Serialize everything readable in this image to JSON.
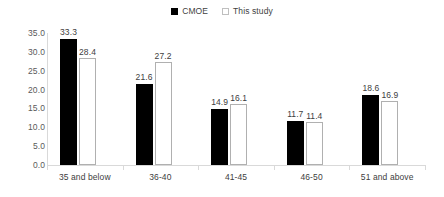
{
  "chart_data": {
    "type": "bar",
    "title": "",
    "subtitle": "",
    "xlabel": "",
    "ylabel": "",
    "categories": [
      "35 and below",
      "36-40",
      "41-45",
      "46-50",
      "51 and above"
    ],
    "series": [
      {
        "name": "CMOE",
        "color": "#000000",
        "style": "filled",
        "values": [
          33.3,
          21.6,
          14.9,
          11.7,
          18.6
        ]
      },
      {
        "name": "This study",
        "color": "#ffffff",
        "style": "hollow",
        "values": [
          28.4,
          27.2,
          16.1,
          11.4,
          16.9
        ]
      }
    ],
    "data_labels": [
      [
        "33.3",
        "21.6",
        "14.9",
        "11.7",
        "18.6"
      ],
      [
        "28.4",
        "27.2",
        "16.1",
        "11.4",
        "16.9"
      ]
    ],
    "ylim": [
      0,
      35
    ],
    "ytick_values": [
      0,
      5,
      10,
      15,
      20,
      25,
      30,
      35
    ],
    "ytick_labels": [
      "0.0",
      "5.0",
      "10.0",
      "15.0",
      "20.0",
      "25.0",
      "30.0",
      "35.0"
    ],
    "grid": false,
    "legend": {
      "position": "top-center",
      "entries": [
        "CMOE",
        "This study"
      ]
    }
  }
}
